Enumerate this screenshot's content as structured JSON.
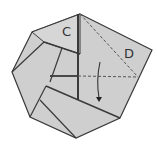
{
  "diagram": {
    "type": "origami-folding-step",
    "labels": {
      "flap_c": "C",
      "flap_d": "D"
    },
    "colors": {
      "paper": "#cfcfcf",
      "edge": "#3a3a3a",
      "fold_line": "#555555",
      "background": "#ffffff"
    },
    "instruction": "fold flap D down along dashed valley fold (arrow)"
  }
}
